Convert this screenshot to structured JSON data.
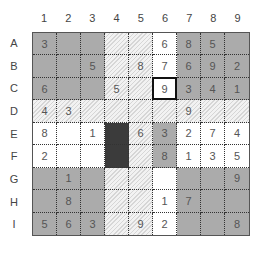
{
  "columns": [
    "1",
    "2",
    "3",
    "4",
    "5",
    "6",
    "7",
    "8",
    "9"
  ],
  "rows": [
    "A",
    "B",
    "C",
    "D",
    "E",
    "F",
    "G",
    "H",
    "I"
  ],
  "selected_cell": "C6",
  "colors": {
    "gray": "#ababab",
    "dark": "#3b3b3b",
    "white": "#ffffff",
    "hatch": "#f2f2f2"
  },
  "cell_styles": [
    [
      "gray",
      "gray",
      "gray",
      "hatch",
      "hatch",
      "white",
      "gray",
      "gray",
      "gray"
    ],
    [
      "gray",
      "gray",
      "gray",
      "hatch",
      "hatch",
      "white",
      "gray",
      "gray",
      "gray"
    ],
    [
      "gray",
      "gray",
      "gray",
      "hatch",
      "hatch",
      "white",
      "gray",
      "gray",
      "gray"
    ],
    [
      "hatch",
      "hatch",
      "hatch",
      "hatch",
      "hatch",
      "hatch",
      "hatch",
      "hatch",
      "hatch"
    ],
    [
      "white",
      "white",
      "white",
      "dark",
      "hatch",
      "gray",
      "white",
      "white",
      "white"
    ],
    [
      "white",
      "white",
      "white",
      "dark",
      "hatch",
      "gray",
      "white",
      "white",
      "white"
    ],
    [
      "gray",
      "gray",
      "gray",
      "hatch",
      "hatch",
      "white",
      "gray",
      "gray",
      "gray"
    ],
    [
      "gray",
      "gray",
      "gray",
      "hatch",
      "hatch",
      "white",
      "gray",
      "gray",
      "gray"
    ],
    [
      "gray",
      "gray",
      "gray",
      "hatch",
      "hatch",
      "white",
      "gray",
      "gray",
      "gray"
    ]
  ],
  "grid": [
    [
      "3",
      "",
      "",
      "",
      "",
      "6",
      "8",
      "5",
      ""
    ],
    [
      "",
      "",
      "5",
      "",
      "8",
      "7",
      "6",
      "9",
      "2"
    ],
    [
      "6",
      "",
      "",
      "5",
      "",
      "9",
      "3",
      "4",
      "1"
    ],
    [
      "4",
      "3",
      "",
      "",
      "",
      "",
      "9",
      "",
      ""
    ],
    [
      "8",
      "",
      "1",
      "",
      "6",
      "3",
      "2",
      "7",
      "4"
    ],
    [
      "2",
      "",
      "",
      "",
      "",
      "8",
      "1",
      "3",
      "5"
    ],
    [
      "",
      "1",
      "",
      "",
      "",
      "",
      "",
      "",
      "9"
    ],
    [
      "",
      "8",
      "",
      "",
      "",
      "1",
      "7",
      "",
      ""
    ],
    [
      "5",
      "6",
      "3",
      "",
      "9",
      "2",
      "",
      "",
      "8"
    ]
  ]
}
